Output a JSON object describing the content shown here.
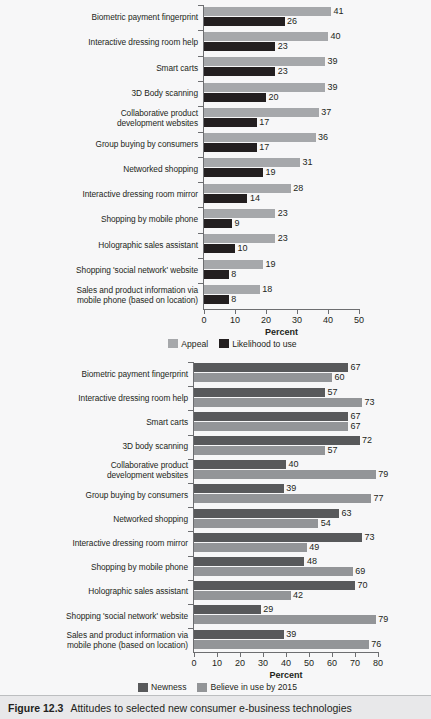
{
  "figure": {
    "number": "Figure 12.3",
    "caption": "Attitudes to selected new consumer e-business technologies"
  },
  "chart_data": [
    {
      "id": "chart-top",
      "type": "bar",
      "orientation": "horizontal",
      "title": "",
      "xlabel": "Percent",
      "ylabel": "",
      "xlim": [
        0,
        50
      ],
      "xticks": [
        0,
        10,
        20,
        30,
        40,
        50
      ],
      "grid": false,
      "legend_position": "below",
      "categories": [
        "Biometric payment fingerprint",
        "Interactive dressing room help",
        "Smart carts",
        "3D Body scanning",
        "Collaborative product\ndevelopment websites",
        "Group buying by consumers",
        "Networked shopping",
        "Interactive dressing room mirror",
        "Shopping by mobile phone",
        "Holographic sales assistant",
        "Shopping 'social network' website",
        "Sales and product information via\nmobile phone (based on location)"
      ],
      "series": [
        {
          "name": "Appeal",
          "color": "#a6a8ab",
          "values": [
            41,
            40,
            39,
            39,
            37,
            36,
            31,
            28,
            23,
            23,
            19,
            18
          ]
        },
        {
          "name": "Likelihood to use",
          "color": "#231f20",
          "values": [
            26,
            23,
            23,
            20,
            17,
            17,
            19,
            14,
            9,
            10,
            8,
            8
          ]
        }
      ]
    },
    {
      "id": "chart-bottom",
      "type": "bar",
      "orientation": "horizontal",
      "title": "",
      "xlabel": "Percent",
      "ylabel": "",
      "xlim": [
        0,
        80
      ],
      "xticks": [
        0,
        10,
        20,
        30,
        40,
        50,
        60,
        70,
        80
      ],
      "grid": false,
      "legend_position": "below",
      "categories": [
        "Biometric payment fingerprint",
        "Interactive dressing room help",
        "Smart carts",
        "3D body scanning",
        "Collaborative product\ndevelopment websites",
        "Group buying by consumers",
        "Networked shopping",
        "Interactive dressing room mirror",
        "Shopping by mobile phone",
        "Holographic sales assistant",
        "Shopping 'social network' website",
        "Sales and product information via\nmobile phone (based on location)"
      ],
      "series": [
        {
          "name": "Newness",
          "color": "#58595b",
          "values": [
            67,
            57,
            67,
            72,
            40,
            39,
            63,
            73,
            48,
            70,
            29,
            39
          ]
        },
        {
          "name": "Believe in use by 2015",
          "color": "#939598",
          "values": [
            60,
            73,
            67,
            57,
            79,
            77,
            54,
            49,
            69,
            42,
            79,
            76
          ]
        }
      ]
    }
  ]
}
